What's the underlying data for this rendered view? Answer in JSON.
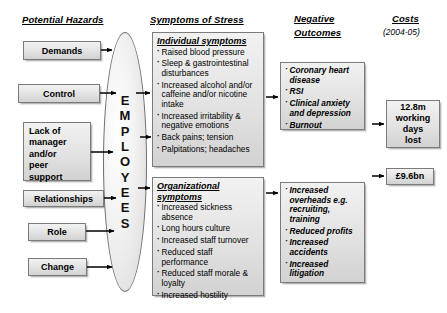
{
  "headings": {
    "hazards": "Potential Hazards",
    "symptoms": "Symptoms of Stress",
    "outcomes_line1": "Negative",
    "outcomes_line2": "Outcomes",
    "costs": "Costs",
    "costs_years": "(2004-05)"
  },
  "hazards": [
    {
      "label": "Demands"
    },
    {
      "label": "Control"
    },
    {
      "label": "Lack of\nmanager\nand/or\npeer\nsupport"
    },
    {
      "label": "Relationships"
    },
    {
      "label": "Role"
    },
    {
      "label": "Change"
    }
  ],
  "center": {
    "letters": [
      "E",
      "M",
      "P",
      "L",
      "O",
      "Y",
      "E",
      "E",
      "S"
    ],
    "word": "EMPLOYEES"
  },
  "symptoms": {
    "individual": {
      "title": "Individual symptoms",
      "items": [
        "Raised blood pressure",
        "Sleep & gastrointestinal disturbances",
        "Increased alcohol and/or caffeine and/or nicotine intake",
        "Increased irritability & negative emotions",
        "Back pains; tension",
        "Palpitations; headaches"
      ]
    },
    "organizational": {
      "title": "Organizational symptoms",
      "items": [
        "Increased sickness absence",
        "Long hours culture",
        "Increased staff turnover",
        "Reduced staff performance",
        "Reduced staff morale & loyalty",
        "Increased hostility"
      ]
    }
  },
  "outcomes": {
    "individual": {
      "items": [
        "Coronary heart disease",
        "RSI",
        "Clinical anxiety and depression",
        "Burnout"
      ]
    },
    "organizational": {
      "items": [
        "Increased overheads e.g. recruiting, training",
        "Reduced profits",
        "Increased accidents",
        "Increased litigation"
      ]
    }
  },
  "costs": [
    {
      "lines": [
        "12.8m",
        "working",
        "days",
        "lost"
      ]
    },
    {
      "lines": [
        "£9.6bn"
      ]
    }
  ],
  "colors": {
    "box_border": "#7b7b7b",
    "box_fill": "#e4e4e4",
    "text": "#000000",
    "arrow": "#000000"
  }
}
